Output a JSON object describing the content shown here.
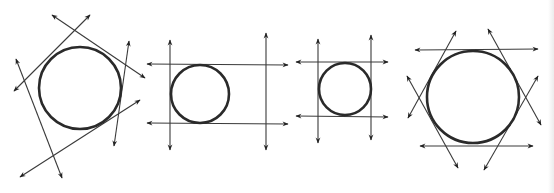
{
  "canvas": {
    "width": 554,
    "height": 193,
    "background": "#ffffff"
  },
  "colors": {
    "circle": "#2a2a2a",
    "line": "#3a3a3a",
    "arrowhead": "#222222"
  },
  "figures": [
    {
      "name": "circle-pentagon-tangents",
      "circle": {
        "cx": 80,
        "cy": 88,
        "r": 41
      },
      "lines": [
        {
          "x1": 14,
          "y1": 91,
          "x2": 90,
          "y2": 15
        },
        {
          "x1": 52,
          "y1": 15,
          "x2": 145,
          "y2": 78
        },
        {
          "x1": 129,
          "y1": 41,
          "x2": 114,
          "y2": 146
        },
        {
          "x1": 20,
          "y1": 177,
          "x2": 140,
          "y2": 100
        },
        {
          "x1": 16,
          "y1": 59,
          "x2": 62,
          "y2": 178
        }
      ]
    },
    {
      "name": "circle-rectangle-tangents",
      "circle": {
        "cx": 200,
        "cy": 94,
        "r": 29
      },
      "lines": [
        {
          "x1": 147,
          "y1": 64,
          "x2": 288,
          "y2": 65
        },
        {
          "x1": 147,
          "y1": 123,
          "x2": 288,
          "y2": 124
        },
        {
          "x1": 170,
          "y1": 40,
          "x2": 170,
          "y2": 150
        },
        {
          "x1": 266,
          "y1": 33,
          "x2": 266,
          "y2": 150
        }
      ]
    },
    {
      "name": "circle-square-tangents",
      "circle": {
        "cx": 345,
        "cy": 89,
        "r": 26
      },
      "lines": [
        {
          "x1": 296,
          "y1": 62,
          "x2": 388,
          "y2": 62
        },
        {
          "x1": 296,
          "y1": 116,
          "x2": 388,
          "y2": 117
        },
        {
          "x1": 318,
          "y1": 39,
          "x2": 318,
          "y2": 143
        },
        {
          "x1": 371,
          "y1": 35,
          "x2": 371,
          "y2": 140
        }
      ]
    },
    {
      "name": "circle-hexagon-tangents",
      "circle": {
        "cx": 473,
        "cy": 97,
        "r": 46
      },
      "lines": [
        {
          "x1": 415,
          "y1": 50,
          "x2": 538,
          "y2": 49
        },
        {
          "x1": 420,
          "y1": 146,
          "x2": 533,
          "y2": 146
        },
        {
          "x1": 408,
          "y1": 118,
          "x2": 456,
          "y2": 31
        },
        {
          "x1": 407,
          "y1": 76,
          "x2": 458,
          "y2": 168
        },
        {
          "x1": 488,
          "y1": 29,
          "x2": 541,
          "y2": 125
        },
        {
          "x1": 484,
          "y1": 170,
          "x2": 538,
          "y2": 76
        }
      ]
    }
  ]
}
